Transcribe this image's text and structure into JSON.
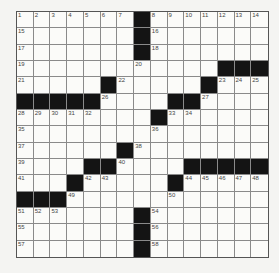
{
  "puzzle": {
    "rows": 15,
    "cols": 15,
    "colors": {
      "block": "#141414",
      "cell": "#fbfbf9",
      "line": "#8a8a8a"
    },
    "blocks": [
      [
        1,
        8
      ],
      [
        2,
        8
      ],
      [
        3,
        8
      ],
      [
        4,
        13
      ],
      [
        4,
        14
      ],
      [
        4,
        15
      ],
      [
        5,
        6
      ],
      [
        5,
        12
      ],
      [
        6,
        1
      ],
      [
        6,
        2
      ],
      [
        6,
        3
      ],
      [
        6,
        4
      ],
      [
        6,
        5
      ],
      [
        6,
        10
      ],
      [
        6,
        11
      ],
      [
        7,
        9
      ],
      [
        9,
        7
      ],
      [
        10,
        5
      ],
      [
        10,
        6
      ],
      [
        10,
        11
      ],
      [
        10,
        12
      ],
      [
        10,
        13
      ],
      [
        10,
        14
      ],
      [
        10,
        15
      ],
      [
        11,
        4
      ],
      [
        11,
        10
      ],
      [
        12,
        1
      ],
      [
        12,
        2
      ],
      [
        12,
        3
      ],
      [
        13,
        8
      ],
      [
        14,
        8
      ],
      [
        15,
        8
      ]
    ],
    "numbers": [
      {
        "r": 1,
        "c": 1,
        "n": "1"
      },
      {
        "r": 1,
        "c": 2,
        "n": "2"
      },
      {
        "r": 1,
        "c": 3,
        "n": "3"
      },
      {
        "r": 1,
        "c": 4,
        "n": "4"
      },
      {
        "r": 1,
        "c": 5,
        "n": "5"
      },
      {
        "r": 1,
        "c": 6,
        "n": "6"
      },
      {
        "r": 1,
        "c": 7,
        "n": "7"
      },
      {
        "r": 1,
        "c": 9,
        "n": "8"
      },
      {
        "r": 1,
        "c": 10,
        "n": "9"
      },
      {
        "r": 1,
        "c": 11,
        "n": "10"
      },
      {
        "r": 1,
        "c": 12,
        "n": "11"
      },
      {
        "r": 1,
        "c": 13,
        "n": "12"
      },
      {
        "r": 1,
        "c": 14,
        "n": "13"
      },
      {
        "r": 1,
        "c": 15,
        "n": "14"
      },
      {
        "r": 2,
        "c": 1,
        "n": "15"
      },
      {
        "r": 2,
        "c": 9,
        "n": "16"
      },
      {
        "r": 3,
        "c": 1,
        "n": "17"
      },
      {
        "r": 3,
        "c": 9,
        "n": "18"
      },
      {
        "r": 4,
        "c": 1,
        "n": "19"
      },
      {
        "r": 4,
        "c": 8,
        "n": "20"
      },
      {
        "r": 5,
        "c": 1,
        "n": "21"
      },
      {
        "r": 5,
        "c": 7,
        "n": "22"
      },
      {
        "r": 5,
        "c": 13,
        "n": "23"
      },
      {
        "r": 5,
        "c": 14,
        "n": "24"
      },
      {
        "r": 5,
        "c": 15,
        "n": "25"
      },
      {
        "r": 6,
        "c": 6,
        "n": "26"
      },
      {
        "r": 6,
        "c": 12,
        "n": "27"
      },
      {
        "r": 7,
        "c": 1,
        "n": "28"
      },
      {
        "r": 7,
        "c": 2,
        "n": "29"
      },
      {
        "r": 7,
        "c": 3,
        "n": "30"
      },
      {
        "r": 7,
        "c": 4,
        "n": "31"
      },
      {
        "r": 7,
        "c": 5,
        "n": "32"
      },
      {
        "r": 7,
        "c": 10,
        "n": "33"
      },
      {
        "r": 7,
        "c": 11,
        "n": "34"
      },
      {
        "r": 8,
        "c": 1,
        "n": "35"
      },
      {
        "r": 8,
        "c": 9,
        "n": "36"
      },
      {
        "r": 9,
        "c": 1,
        "n": "37"
      },
      {
        "r": 9,
        "c": 8,
        "n": "38"
      },
      {
        "r": 10,
        "c": 1,
        "n": "39"
      },
      {
        "r": 10,
        "c": 7,
        "n": "40"
      },
      {
        "r": 11,
        "c": 1,
        "n": "41"
      },
      {
        "r": 11,
        "c": 5,
        "n": "42"
      },
      {
        "r": 11,
        "c": 6,
        "n": "43"
      },
      {
        "r": 11,
        "c": 11,
        "n": "44"
      },
      {
        "r": 11,
        "c": 12,
        "n": "45"
      },
      {
        "r": 11,
        "c": 13,
        "n": "46"
      },
      {
        "r": 11,
        "c": 14,
        "n": "47"
      },
      {
        "r": 11,
        "c": 15,
        "n": "48"
      },
      {
        "r": 12,
        "c": 4,
        "n": "49"
      },
      {
        "r": 12,
        "c": 10,
        "n": "50"
      },
      {
        "r": 13,
        "c": 1,
        "n": "51"
      },
      {
        "r": 13,
        "c": 2,
        "n": "52"
      },
      {
        "r": 13,
        "c": 3,
        "n": "53"
      },
      {
        "r": 13,
        "c": 9,
        "n": "54"
      },
      {
        "r": 14,
        "c": 1,
        "n": "55"
      },
      {
        "r": 14,
        "c": 9,
        "n": "56"
      },
      {
        "r": 15,
        "c": 1,
        "n": "57"
      },
      {
        "r": 15,
        "c": 9,
        "n": "58"
      }
    ]
  }
}
